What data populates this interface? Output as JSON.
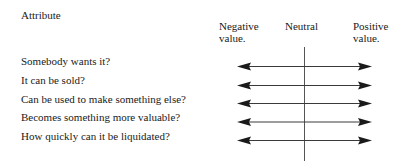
{
  "header": {
    "attribute_label": "Attribute",
    "negative_label": "Negative\nvalue.",
    "neutral_label": "Neutral",
    "positive_label": "Positive\nvalue."
  },
  "attributes": [
    {
      "label": "Somebody wants it?"
    },
    {
      "label": "It can be sold?"
    },
    {
      "label": "Can be used to make something else?"
    },
    {
      "label": "Becomes something more valuable?"
    },
    {
      "label": "How quickly can it be liquidated?"
    }
  ],
  "colors": {
    "line": "#3a3a3a",
    "arrowhead": "#1a1a1a",
    "axis": "#555555"
  }
}
